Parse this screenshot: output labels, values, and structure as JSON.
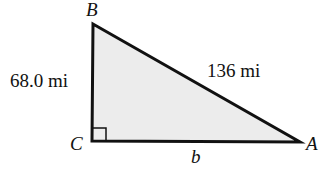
{
  "diagram": {
    "type": "right-triangle",
    "vertices": {
      "A": {
        "label": "A",
        "x": 300,
        "y": 142
      },
      "B": {
        "label": "B",
        "x": 93,
        "y": 24
      },
      "C": {
        "label": "C",
        "x": 92,
        "y": 141
      }
    },
    "sides": {
      "BC": {
        "label": "68.0 mi"
      },
      "AB": {
        "label": "136 mi"
      },
      "AC": {
        "label": "b"
      }
    },
    "right_angle_at": "C",
    "fill_color": "#ececec",
    "stroke_color": "#111111"
  }
}
